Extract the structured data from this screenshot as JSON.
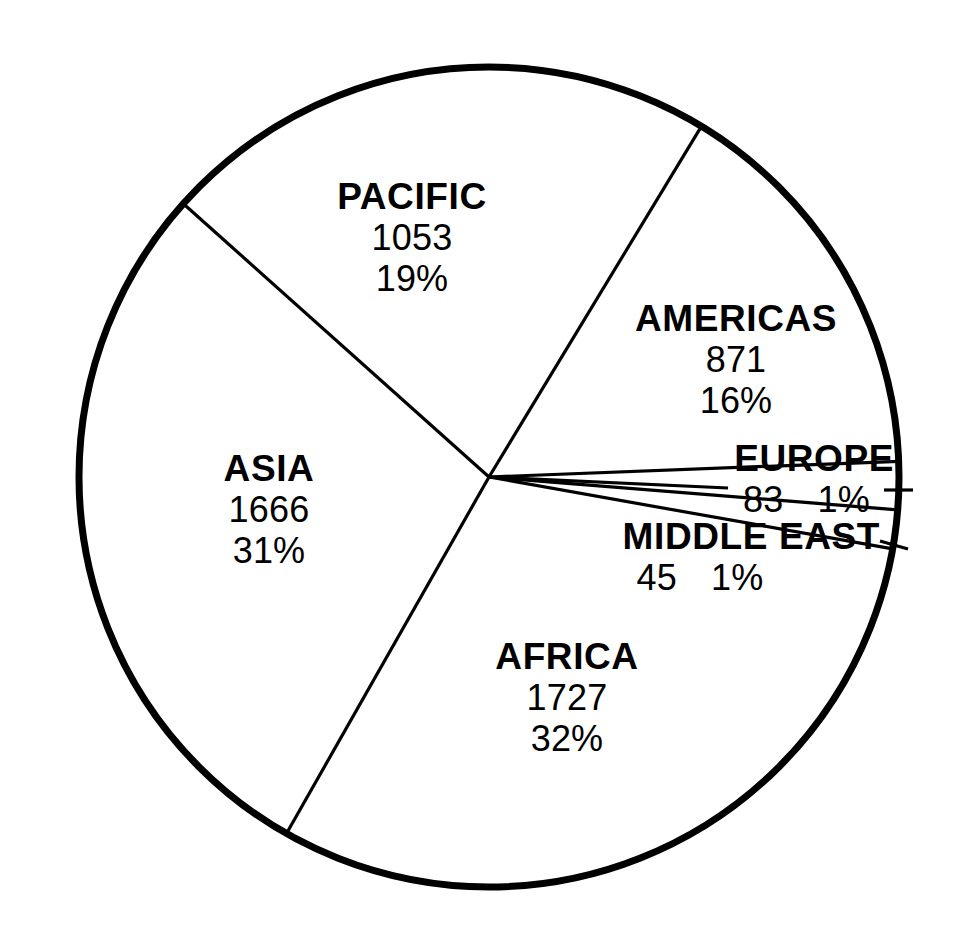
{
  "chart_data": {
    "type": "pie",
    "title": "",
    "subtitle": "",
    "xlabel": "",
    "ylabel": "",
    "legend_position": "none",
    "grid": false,
    "label_format": "name / value / percent",
    "total": 5445,
    "categories": [
      "PACIFIC",
      "AMERICAS",
      "EUROPE",
      "MIDDLE EAST",
      "AFRICA",
      "ASIA"
    ],
    "values": [
      1053,
      871,
      83,
      45,
      1727,
      1666
    ],
    "percents": [
      19,
      16,
      1,
      1,
      32,
      31
    ],
    "slices": [
      {
        "name": "PACIFIC",
        "value": "1053",
        "percent": "19%",
        "value_number": 1053,
        "percent_number": 19,
        "start_angle_deg": 58.8,
        "end_angle_deg": 138.2,
        "label_placement": "inside"
      },
      {
        "name": "AMERICAS",
        "value": "871",
        "percent": "16%",
        "value_number": 871,
        "percent_number": 16,
        "start_angle_deg": 2.2,
        "end_angle_deg": 58.8,
        "label_placement": "inside"
      },
      {
        "name": "EUROPE",
        "value": "83",
        "percent": "1%",
        "value_number": 83,
        "percent_number": 1,
        "start_angle_deg": -4.6,
        "end_angle_deg": 2.2,
        "label_placement": "leader-line"
      },
      {
        "name": "MIDDLE EAST",
        "value": "45",
        "percent": "1%",
        "value_number": 45,
        "percent_number": 1,
        "start_angle_deg": -10.1,
        "end_angle_deg": -4.6,
        "label_placement": "leader-line"
      },
      {
        "name": "AFRICA",
        "value": "1727",
        "percent": "32%",
        "value_number": 1727,
        "percent_number": 32,
        "start_angle_deg": -119.6,
        "end_angle_deg": -10.1,
        "label_placement": "inside"
      },
      {
        "name": "ASIA",
        "value": "1666",
        "percent": "31%",
        "value_number": 1666,
        "percent_number": 31,
        "start_angle_deg": 138.2,
        "end_angle_deg": 240.4,
        "label_placement": "inside"
      }
    ],
    "colors": {
      "slice_fill": "#ffffff",
      "outline": "#000000",
      "divider": "#000000",
      "text": "#000000",
      "background": "#ffffff"
    },
    "geometry": {
      "center_x": 489,
      "center_y": 477,
      "radius": 410,
      "outline_width": 7,
      "divider_width": 3.2
    }
  },
  "labels": {
    "pacific": {
      "name": "PACIFIC",
      "value": "1053",
      "percent": "19%"
    },
    "americas": {
      "name": "AMERICAS",
      "value": "871",
      "percent": "16%"
    },
    "europe": {
      "name": "EUROPE",
      "value": "83",
      "percent": "1%"
    },
    "middle_east": {
      "name": "MIDDLE EAST",
      "value": "45",
      "percent": "1%"
    },
    "africa": {
      "name": "AFRICA",
      "value": "1727",
      "percent": "32%"
    },
    "asia": {
      "name": "ASIA",
      "value": "1666",
      "percent": "31%"
    }
  }
}
